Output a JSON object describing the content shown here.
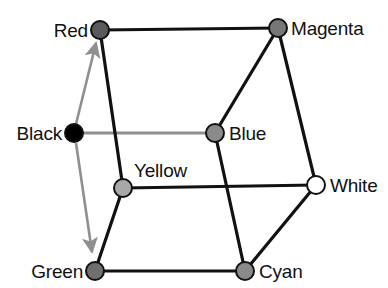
{
  "figure": {
    "background": "#ffffff",
    "width": 388,
    "height": 288
  },
  "style": {
    "edge_color": "#111111",
    "edge_width": 3,
    "axis_color": "#8f8f8f",
    "axis_width": 3,
    "node_stroke": "#111111",
    "node_stroke_width": 2,
    "node_radius": 9,
    "label_color": "#111111",
    "label_font_size": "19px"
  },
  "vertices": [
    {
      "id": "red",
      "label": "Red",
      "x": 100,
      "y": 30,
      "fill": "#5a5a5a",
      "label_x": 88,
      "label_y": 30,
      "label_pos": "lbl-left"
    },
    {
      "id": "magenta",
      "label": "Magenta",
      "x": 278,
      "y": 28,
      "fill": "#777777",
      "label_x": 291,
      "label_y": 28,
      "label_pos": "lbl-right"
    },
    {
      "id": "black",
      "label": "Black",
      "x": 74,
      "y": 133,
      "fill": "#000000",
      "label_x": 62,
      "label_y": 133,
      "label_pos": "lbl-left"
    },
    {
      "id": "blue",
      "label": "Blue",
      "x": 215,
      "y": 133,
      "fill": "#8a8a8a",
      "label_x": 229,
      "label_y": 133,
      "label_pos": "lbl-right"
    },
    {
      "id": "yellow",
      "label": "Yellow",
      "x": 123,
      "y": 188,
      "fill": "#a8a8a8",
      "label_x": 137,
      "label_y": 172,
      "label_pos": "lbl-right"
    },
    {
      "id": "white",
      "label": "White",
      "x": 316,
      "y": 185,
      "fill": "#ffffff",
      "label_x": 330,
      "label_y": 185,
      "label_pos": "lbl-right"
    },
    {
      "id": "green",
      "label": "Green",
      "x": 95,
      "y": 271,
      "fill": "#6f6f6f",
      "label_x": 83,
      "label_y": 271,
      "label_pos": "lbl-left"
    },
    {
      "id": "cyan",
      "label": "Cyan",
      "x": 245,
      "y": 271,
      "fill": "#8a8a8a",
      "label_x": 259,
      "label_y": 271,
      "label_pos": "lbl-right"
    }
  ],
  "edges": [
    {
      "id": "red-magenta",
      "from": "red",
      "to": "magenta",
      "kind": "solid"
    },
    {
      "id": "red-yellow",
      "from": "red",
      "to": "yellow",
      "kind": "solid"
    },
    {
      "id": "magenta-blue",
      "from": "magenta",
      "to": "blue",
      "kind": "solid"
    },
    {
      "id": "magenta-white",
      "from": "magenta",
      "to": "white",
      "kind": "solid"
    },
    {
      "id": "blue-cyan",
      "from": "blue",
      "to": "cyan",
      "kind": "solid"
    },
    {
      "id": "yellow-white",
      "from": "yellow",
      "to": "white",
      "kind": "solid"
    },
    {
      "id": "yellow-green",
      "from": "yellow",
      "to": "green",
      "kind": "solid"
    },
    {
      "id": "green-cyan",
      "from": "green",
      "to": "cyan",
      "kind": "solid"
    },
    {
      "id": "cyan-white",
      "from": "cyan",
      "to": "white",
      "kind": "solid"
    },
    {
      "id": "black-blue",
      "from": "black",
      "to": "blue",
      "kind": "axis"
    }
  ],
  "axis_arrows": [
    {
      "id": "black-to-red",
      "from": "black",
      "to": "red",
      "color": "#8f8f8f"
    },
    {
      "id": "black-to-green",
      "from": "black",
      "to": "green",
      "color": "#8f8f8f"
    }
  ]
}
